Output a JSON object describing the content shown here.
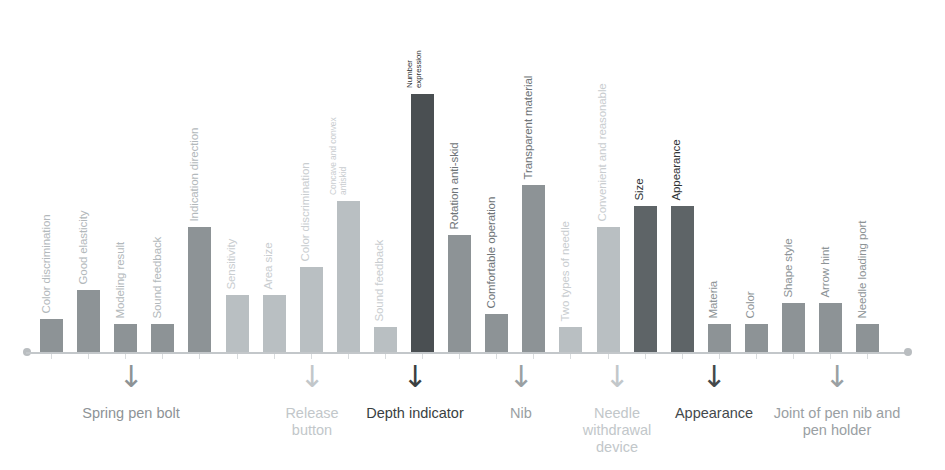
{
  "chart_data": {
    "type": "bar",
    "title": "",
    "subtitle": "",
    "xlabel": "",
    "ylabel": "",
    "grid": false,
    "legend": "none",
    "ylim": [
      0,
      100
    ],
    "axis_color": "#c3c7ca",
    "categories": [
      "Color discrimination",
      "Good elasticity",
      "Modeling result",
      "Sound feedback",
      "Indication direction",
      "Sensitivity",
      "Area size",
      "Color discrimination",
      "Concave and convex antiskid",
      "Sound feedback",
      "Number expression",
      "Rotation anti-skid",
      "Comfortable operation",
      "Transparent material",
      "Two types of needle",
      "Convenient and reasonable",
      "Size",
      "Appearance",
      "Materia",
      "Color",
      "Shape style",
      "Arrow hint",
      "Needle loading port"
    ],
    "values": [
      13,
      24,
      11,
      11,
      48,
      22,
      22,
      33,
      58,
      10,
      99,
      45,
      15,
      64,
      10,
      48,
      56,
      56,
      11,
      11,
      19,
      19,
      11
    ],
    "bar_colors": [
      "#8d9396",
      "#8d9396",
      "#8d9396",
      "#8d9396",
      "#8d9396",
      "#b9bfc2",
      "#b9bfc2",
      "#b9bfc2",
      "#b9bfc2",
      "#b9bfc2",
      "#4a4f52",
      "#8d9396",
      "#8d9396",
      "#8d9396",
      "#b9bfc2",
      "#b9bfc2",
      "#5e6467",
      "#5e6467",
      "#8d9396",
      "#8d9396",
      "#8d9396",
      "#8d9396",
      "#8d9396"
    ],
    "label_colors": [
      "#b2b8bb",
      "#b2b8bb",
      "#b2b8bb",
      "#b2b8bb",
      "#b2b8bb",
      "#c9cdd0",
      "#c9cdd0",
      "#c9cdd0",
      "#c9cdd0",
      "#c9cdd0",
      "#2f3436",
      "#6e7477",
      "#6e7477",
      "#6e7477",
      "#c9cdd0",
      "#c9cdd0",
      "#2f3436",
      "#2f3436",
      "#8d9396",
      "#8d9396",
      "#8d9396",
      "#8d9396",
      "#8d9396"
    ],
    "groups": [
      {
        "name": "Spring pen bolt",
        "arrow": "↓",
        "color": "#8d9396",
        "center_x": 131,
        "label_width": 170
      },
      {
        "name": "Release button",
        "arrow": "↓",
        "color": "#c2c7ca",
        "center_x": 312,
        "label_width": 96
      },
      {
        "name": "Depth indicator",
        "arrow": "↓",
        "color": "#3a3f42",
        "center_x": 415,
        "label_width": 104
      },
      {
        "name": "Nib",
        "arrow": "↓",
        "color": "#9aa0a3",
        "center_x": 521,
        "label_width": 96
      },
      {
        "name": "Needle withdrawal device",
        "arrow": "↓",
        "color": "#c2c7ca",
        "center_x": 617,
        "label_width": 92
      },
      {
        "name": "Appearance",
        "arrow": "↓",
        "color": "#44494c",
        "center_x": 714,
        "label_width": 116
      },
      {
        "name": "Joint of pen nib and pen holder",
        "arrow": "↓",
        "color": "#9aa0a3",
        "center_x": 837,
        "label_width": 150
      }
    ]
  }
}
